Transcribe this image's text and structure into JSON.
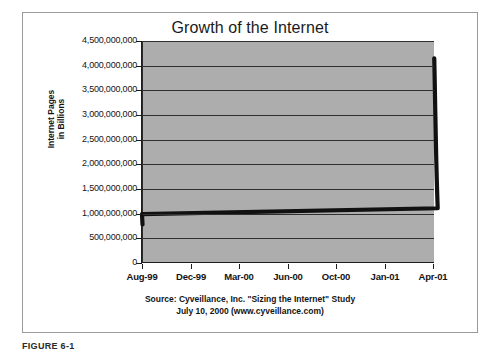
{
  "figure": {
    "caption": "FIGURE 6-1"
  },
  "chart_data": {
    "type": "line",
    "title": "Growth of the Internet",
    "xlabel": "",
    "ylabel": "Internet Pages in Billions",
    "ylabel_lines": [
      "Internet Pages",
      "in Billions"
    ],
    "grid": true,
    "legend": "none",
    "ylim": [
      0,
      4500000000
    ],
    "y_ticks": [
      0,
      500000000,
      1000000000,
      1500000000,
      2000000000,
      2500000000,
      3000000000,
      3500000000,
      4000000000,
      4500000000
    ],
    "y_tick_labels": [
      "4,500,000,000",
      "4,000,000,000",
      "3,500,000,000",
      "3,000,000,000",
      "2,500,000,000",
      "2,000,000,000",
      "1,500,000,000",
      "1,000,000,000",
      "500,000,000",
      "0"
    ],
    "x_tick_labels": [
      "Aug-99",
      "Dec-99",
      "Mar-00",
      "Jun-00",
      "Oct-00",
      "Jan-01",
      "Apr-01"
    ],
    "xlim": [
      "Aug-99",
      "Apr-01"
    ],
    "series": [
      {
        "name": "Internet Pages",
        "x": [
          "Oct-99",
          "Nov-99",
          "Dec-99",
          "Jan-00",
          "Feb-00",
          "Mar-00",
          "Apr-00",
          "May-00",
          "Jun-00",
          "Jul-00",
          "Aug-00",
          "Sep-00",
          "Oct-00",
          "Nov-00",
          "Dec-00",
          "Jan-01",
          "Feb-01",
          "Mar-01"
        ],
        "values": [
          780000000,
          880000000,
          990000000,
          1110000000,
          1250000000,
          1400000000,
          1560000000,
          1740000000,
          1930000000,
          2140000000,
          2370000000,
          2610000000,
          2860000000,
          3120000000,
          3390000000,
          3660000000,
          3930000000,
          4150000000
        ]
      }
    ],
    "annotations": [
      "Source: Cyveillance, Inc. \"Sizing the Internet\" Study",
      "July 10, 2000 (www.cyveillance.com)"
    ],
    "source_lines": [
      "Source: Cyveillance, Inc. \"Sizing the Internet\" Study",
      "July 10, 2000 (www.cyveillance.com)"
    ],
    "colors": {
      "plot_background": "#adadad",
      "gridline": "#303030",
      "series_line": "#111111",
      "axis": "#1c1c1c",
      "page_background": "#ffffff",
      "frame_border": "#9a9a9a"
    }
  }
}
